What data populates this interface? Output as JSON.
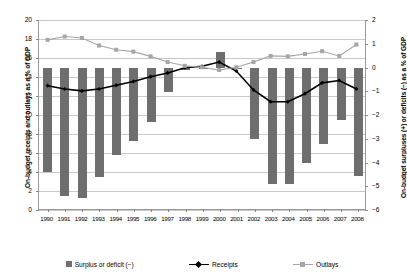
{
  "chart_data": {
    "type": "bar",
    "title": "",
    "xlabel": "",
    "ylabel": "On-budget receipts and outlays as a % of GDP",
    "y2label": "On-budget surpluses (+) or deficits (−) as a % of GDP",
    "grid": true,
    "legend_position": "bottom",
    "ylim": [
      0,
      20
    ],
    "y2lim": [
      -6,
      2
    ],
    "yticks": [
      0,
      2,
      4,
      6,
      8,
      10,
      12,
      14,
      16,
      18,
      20
    ],
    "ytick_labels": [
      "0",
      "2",
      "4",
      "6",
      "8",
      "10",
      "12",
      "14",
      "16",
      "18",
      "20"
    ],
    "y2ticks": [
      -6,
      -5,
      -4,
      -3,
      -2,
      -1,
      0,
      1,
      2
    ],
    "y2tick_labels": [
      "−6",
      "−5",
      "−4",
      "−3",
      "−2",
      "−1",
      "0",
      "1",
      "2"
    ],
    "categories": [
      "1990",
      "1991",
      "1992",
      "1993",
      "1994",
      "1995",
      "1996",
      "1997",
      "1998",
      "1999",
      "2000",
      "2001",
      "2002",
      "2003",
      "2004",
      "2005",
      "2006",
      "2007",
      "2008"
    ],
    "series": [
      {
        "name": "Surplus or deficit (−)",
        "type": "bar",
        "axis": "right",
        "color": "#6e6e6e",
        "values": [
          -4.4,
          -5.4,
          -5.5,
          -4.6,
          -3.7,
          -3.1,
          -2.3,
          -1.05,
          -0.1,
          0.0,
          0.65,
          0.0,
          -3.0,
          -4.9,
          -4.9,
          -4.0,
          -3.2,
          -2.2,
          -4.55
        ]
      },
      {
        "name": "Receipts",
        "type": "line",
        "axis": "left",
        "color": "#000000",
        "values": [
          13.05,
          12.7,
          12.5,
          12.7,
          13.1,
          13.5,
          14.0,
          14.4,
          14.95,
          15.1,
          15.55,
          14.6,
          12.6,
          11.35,
          11.35,
          12.2,
          13.35,
          13.6,
          12.7
        ]
      },
      {
        "name": "Outlays",
        "type": "line",
        "axis": "left",
        "color": "#a6a6a6",
        "values": [
          17.9,
          18.25,
          18.1,
          17.3,
          16.85,
          16.65,
          16.15,
          15.55,
          15.15,
          15.0,
          14.7,
          15.0,
          15.55,
          16.2,
          16.15,
          16.4,
          16.7,
          16.2,
          17.4
        ]
      }
    ]
  },
  "legend": {
    "items": [
      {
        "label": "Surplus or deficit (−)",
        "marker": "bar-swatch",
        "color": "#6e6e6e"
      },
      {
        "label": "Receipts",
        "marker": "line-diamond",
        "color": "#000000"
      },
      {
        "label": "Outlays",
        "marker": "line-square",
        "color": "#a6a6a6"
      }
    ]
  },
  "colors": {
    "bar": "#6e6e6e",
    "receipts": "#000000",
    "outlays": "#a6a6a6",
    "grid": "#c8c8c8",
    "axis": "#9a9a9a",
    "background": "#ffffff"
  }
}
